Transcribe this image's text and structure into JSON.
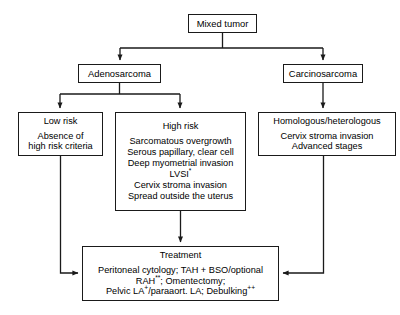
{
  "diagram": {
    "stroke_color": "#1a1a1a",
    "background_color": "#ffffff",
    "nodes": {
      "mixed_tumor": {
        "label": "Mixed tumor"
      },
      "adenosarcoma": {
        "label": "Adenosarcoma"
      },
      "carcinosarcoma": {
        "label": "Carcinosarcoma"
      },
      "low_risk": {
        "title": "Low risk",
        "lines": [
          "Absence of",
          "high risk criteria"
        ]
      },
      "high_risk": {
        "title": "High risk",
        "lines": [
          "Sarcomatous overgrowth",
          "Serous papillary, clear cell",
          "Deep myometrial invasion",
          "LVSI*",
          "Cervix stroma invasion",
          "Spread outside the uterus"
        ]
      },
      "homologous": {
        "title": "Homologous/heterologous",
        "lines": [
          "Cervix stroma invasion",
          "Advanced stages"
        ]
      },
      "treatment": {
        "title": "Treatment",
        "lines": [
          "Peritoneal cytology; TAH + BSO/optional",
          "RAH**; Omentectomy;",
          "Pelvic LA+/paraaort. LA; Debulking++"
        ]
      }
    },
    "edges": [
      {
        "from": "mixed_tumor",
        "to": "adenosarcoma",
        "type": "elbow-down-left-arrow"
      },
      {
        "from": "mixed_tumor",
        "to": "carcinosarcoma",
        "type": "elbow-down-right-arrow"
      },
      {
        "from": "adenosarcoma",
        "to": "low_risk",
        "type": "elbow-down-left-arrow"
      },
      {
        "from": "adenosarcoma",
        "to": "high_risk",
        "type": "elbow-down-right-arrow"
      },
      {
        "from": "carcinosarcoma",
        "to": "homologous",
        "type": "straight-down-arrow"
      },
      {
        "from": "low_risk",
        "to": "treatment",
        "type": "down-then-right-arrow"
      },
      {
        "from": "high_risk",
        "to": "treatment",
        "type": "straight-down-arrow"
      },
      {
        "from": "homologous",
        "to": "treatment",
        "type": "down-then-left-arrow"
      }
    ]
  }
}
